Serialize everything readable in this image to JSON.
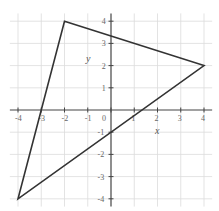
{
  "chart_data": {
    "type": "scatter",
    "title": "",
    "xlabel": "x",
    "ylabel": "y",
    "xlim": [
      -4,
      4
    ],
    "ylim": [
      -4,
      4
    ],
    "grid": true,
    "x_ticks": [
      -4,
      -3,
      -2,
      -1,
      0,
      1,
      2,
      3,
      4
    ],
    "y_ticks": [
      -4,
      -3,
      -2,
      -1,
      1,
      2,
      3,
      4
    ],
    "x_tick_labels": [
      "-4",
      "-3",
      "-2",
      "-1",
      "0",
      "1",
      "2",
      "3",
      "4"
    ],
    "y_tick_labels": [
      "-4",
      "-3",
      "-2",
      "-1",
      "1",
      "2",
      "3",
      "4"
    ],
    "series": [
      {
        "name": "triangle",
        "closed": true,
        "points": [
          {
            "x": -2,
            "y": 4
          },
          {
            "x": 4,
            "y": 2
          },
          {
            "x": -4,
            "y": -4
          }
        ]
      }
    ]
  },
  "colors": {
    "grid": "#dcdcdc",
    "axis": "#444444",
    "shape": "#333333",
    "labels": "#666666"
  }
}
